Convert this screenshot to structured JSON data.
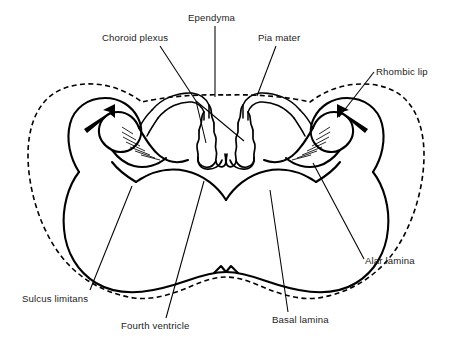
{
  "figure": {
    "background_color": "#ffffff",
    "line_color": "#000000",
    "style": "black-and-white line drawing"
  },
  "labels": {
    "choroid_plexus": "Choroid plexus",
    "ependyma": "Ependyma",
    "pia_mater": "Pia mater",
    "rhombic_lip": "Rhombic lip",
    "alar_lamina": "Alar lamina",
    "basal_lamina": "Basal lamina",
    "fourth_ventricle": "Fourth ventricle",
    "sulcus_limitans": "Sulcus limitans"
  },
  "annotations": {
    "left_arrow": "migration-arrow-left",
    "right_arrow": "migration-arrow-right"
  }
}
